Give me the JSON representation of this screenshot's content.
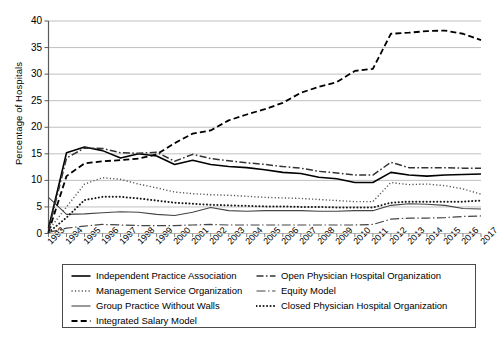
{
  "chart_data": {
    "type": "line",
    "title": "",
    "xlabel": "",
    "ylabel": "Percentage of Hospitals",
    "ylim": [
      0,
      40
    ],
    "ytick_step": 5,
    "yticks": [
      0,
      5,
      10,
      15,
      20,
      25,
      30,
      35,
      40
    ],
    "grid": true,
    "legend_position": "bottom",
    "x": [
      1993,
      1994,
      1995,
      1996,
      1997,
      1998,
      1999,
      2000,
      2001,
      2002,
      2003,
      2004,
      2005,
      2006,
      2007,
      2008,
      2009,
      2010,
      2011,
      2012,
      2013,
      2014,
      2015,
      2016,
      2017
    ],
    "categories": [
      "1993",
      "1994",
      "1995",
      "1996",
      "1997",
      "1998",
      "1999",
      "2000",
      "2001",
      "2002",
      "2003",
      "2004",
      "2005",
      "2006",
      "2007",
      "2008",
      "2009",
      "2010",
      "2011",
      "2012",
      "2013",
      "2014",
      "2015",
      "2016",
      "2017"
    ],
    "series": [
      {
        "name": "Independent Practice Association",
        "style": "solid",
        "color": "#000000",
        "width": 1.6,
        "values": [
          1.0,
          15.2,
          16.3,
          15.6,
          14.2,
          15.0,
          14.6,
          13.0,
          13.8,
          13.0,
          12.6,
          12.4,
          12.0,
          11.5,
          11.3,
          10.6,
          10.3,
          9.6,
          9.6,
          11.5,
          11.0,
          10.8,
          11.0,
          11.1,
          11.2
        ]
      },
      {
        "name": "Management Service Organization",
        "style": "dotted-fine",
        "color": "#555555",
        "width": 1.4,
        "values": [
          0.6,
          5.0,
          9.3,
          10.5,
          10.2,
          9.3,
          8.6,
          7.8,
          7.5,
          7.3,
          7.2,
          7.0,
          6.8,
          6.7,
          6.6,
          6.4,
          6.2,
          6.0,
          6.0,
          9.6,
          9.2,
          9.3,
          9.0,
          8.4,
          7.4
        ]
      },
      {
        "name": "Group Practice Without Walls",
        "style": "solid-thin",
        "color": "#444444",
        "width": 1.1,
        "values": [
          6.8,
          3.6,
          3.7,
          3.9,
          4.1,
          4.0,
          3.6,
          3.4,
          4.0,
          4.9,
          4.3,
          4.2,
          4.3,
          4.3,
          4.3,
          4.2,
          4.2,
          4.3,
          4.3,
          5.3,
          5.6,
          5.5,
          5.3,
          4.7,
          4.6
        ]
      },
      {
        "name": "Integrated Salary Model",
        "style": "dashed",
        "color": "#000000",
        "width": 1.8,
        "values": [
          0.3,
          10.8,
          13.2,
          13.6,
          13.8,
          14.1,
          14.9,
          17.0,
          18.8,
          19.4,
          21.3,
          22.4,
          23.4,
          24.6,
          26.5,
          27.6,
          28.5,
          30.6,
          31.0,
          37.6,
          37.8,
          38.1,
          38.2,
          37.6,
          36.4
        ]
      },
      {
        "name": "Open Physician Hospital Organization",
        "style": "dash-dot",
        "color": "#333333",
        "width": 1.5,
        "values": [
          0.6,
          14.2,
          16.1,
          16.0,
          15.2,
          15.1,
          15.3,
          13.6,
          14.9,
          14.1,
          13.7,
          13.3,
          13.0,
          12.6,
          12.3,
          11.7,
          11.4,
          11.0,
          11.0,
          13.4,
          12.4,
          12.4,
          12.4,
          12.3,
          12.3
        ]
      },
      {
        "name": "Equity Model",
        "style": "dash-dot-long",
        "color": "#444444",
        "width": 1.2,
        "values": [
          0.2,
          1.0,
          1.4,
          1.7,
          1.6,
          1.5,
          1.5,
          1.5,
          1.6,
          1.7,
          1.6,
          1.6,
          1.6,
          1.6,
          1.6,
          1.6,
          1.6,
          1.6,
          1.7,
          2.7,
          2.9,
          2.9,
          3.0,
          3.2,
          3.3
        ]
      },
      {
        "name": "Closed Physician Hospital Organization",
        "style": "dotted-bold",
        "color": "#1a1a1a",
        "width": 2.0,
        "values": [
          0.2,
          3.0,
          6.3,
          6.9,
          6.9,
          6.6,
          6.2,
          5.8,
          5.6,
          5.4,
          5.3,
          5.2,
          5.1,
          5.1,
          5.0,
          5.0,
          4.9,
          4.9,
          4.9,
          5.8,
          6.0,
          6.0,
          6.0,
          6.0,
          6.2
        ]
      }
    ]
  },
  "legend": {
    "column_left": [
      "Independent Practice Association",
      "Management Service Organization",
      "Group Practice Without Walls",
      "Integrated Salary Model"
    ],
    "column_right": [
      "Open Physician Hospital Organization",
      "Equity Model",
      "Closed Physician Hospital Organization"
    ]
  },
  "axis_colors": {
    "grid": "#b9b9b9",
    "axis": "#5a5a5a",
    "text": "#000000"
  }
}
